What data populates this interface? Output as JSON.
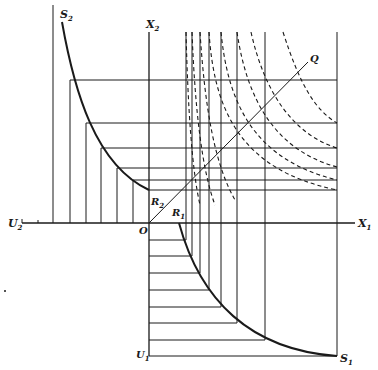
{
  "diagram": {
    "type": "economic-construction",
    "labels": {
      "S2": {
        "main": "S",
        "sub": "2"
      },
      "X2": {
        "main": "X",
        "sub": "2"
      },
      "Q": {
        "main": "Q",
        "sub": ""
      },
      "R2": {
        "main": "R",
        "sub": "2"
      },
      "R1": {
        "main": "R",
        "sub": "1"
      },
      "U2": {
        "main": "U",
        "sub": "2"
      },
      "O": {
        "main": "O",
        "sub": ""
      },
      "X1": {
        "main": "X",
        "sub": "1"
      },
      "U1": {
        "main": "U",
        "sub": "1"
      },
      "S1": {
        "main": "S",
        "sub": "1"
      }
    },
    "colors": {
      "ink": "#1a1a1a",
      "background": "#ffffff"
    },
    "origin": {
      "x": 149,
      "y": 223
    },
    "axes": {
      "X1_axis": {
        "from": [
          22,
          223
        ],
        "to": [
          355,
          223
        ]
      },
      "X2_axis": {
        "from": [
          149,
          32
        ],
        "to": [
          149,
          356
        ]
      },
      "U1_base": {
        "from": [
          149,
          356
        ],
        "to": [
          337,
          356
        ]
      },
      "left_boundary": {
        "from": [
          53,
          5
        ],
        "to": [
          53,
          223
        ]
      },
      "right_boundary": {
        "from": [
          337,
          32
        ],
        "to": [
          337,
          356
        ]
      }
    },
    "upper_horizontals_y": [
      80,
      123,
      148,
      168,
      180,
      190
    ],
    "upper_left_verticals_x": [
      69,
      85,
      101,
      117,
      133
    ],
    "right_verticals_x": [
      186,
      192,
      200,
      209,
      221,
      237,
      265
    ],
    "lower_horizontals_y": [
      240,
      256,
      273,
      290,
      307,
      323,
      340
    ],
    "ray_Q": {
      "from": [
        149,
        223
      ],
      "to": [
        308,
        62
      ]
    },
    "curve_S2": "M62,22 C80,110 100,170 149,190",
    "curve_S1": "M179,223 C205,300 250,345 337,356",
    "dashed_curves": [
      "M193,32 C200,100 215,160 265,205",
      "M265,32 C280,90 300,110 337,123",
      "M237,32 C245,100 280,135 337,148",
      "M221,32 C228,110 270,155 337,167",
      "M209,32 C214,120 260,170 337,180",
      "M200,32 C204,130 250,180 337,190"
    ]
  }
}
